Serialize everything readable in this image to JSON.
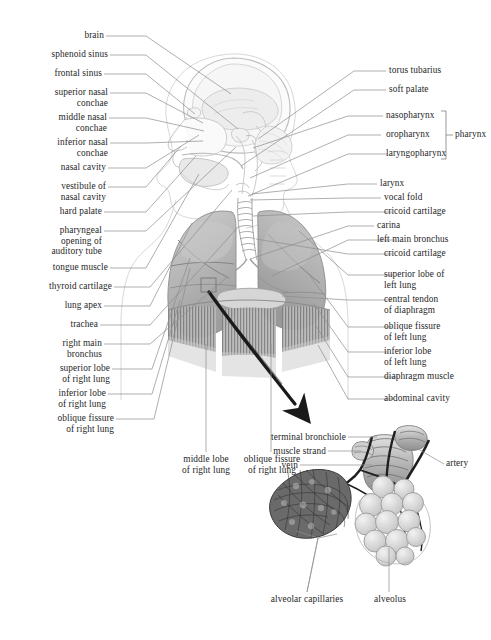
{
  "figure": {
    "kind": "anatomical-illustration",
    "background_color": "#ffffff",
    "ink_color": "#262626",
    "leader_color": "#8d8d8d",
    "arrow_color": "#1a1a1a"
  },
  "labels_left": [
    {
      "text": "brain",
      "lines": [
        "brain"
      ]
    },
    {
      "text": "sphenoid sinus",
      "lines": [
        "sphenoid sinus"
      ]
    },
    {
      "text": "frontal sinus",
      "lines": [
        "frontal sinus"
      ]
    },
    {
      "text": "superior nasal conchae",
      "lines": [
        "superior nasal",
        "conchae"
      ]
    },
    {
      "text": "middle nasal conchae",
      "lines": [
        "middle nasal",
        "conchae"
      ]
    },
    {
      "text": "inferior nasal conchae",
      "lines": [
        "inferior nasal",
        "conchae"
      ]
    },
    {
      "text": "nasal cavity",
      "lines": [
        "nasal cavity"
      ]
    },
    {
      "text": "vestibule of nasal cavity",
      "lines": [
        "vestibule of",
        "nasal cavity"
      ]
    },
    {
      "text": "hard palate",
      "lines": [
        "hard palate"
      ]
    },
    {
      "text": "pharyngeal opening of auditory tube",
      "lines": [
        "pharyngeal",
        "opening of",
        "auditory tube"
      ]
    },
    {
      "text": "tongue muscle",
      "lines": [
        "tongue muscle"
      ]
    },
    {
      "text": "thyroid cartilage",
      "lines": [
        "thyroid cartilage"
      ]
    },
    {
      "text": "lung apex",
      "lines": [
        "lung apex"
      ]
    },
    {
      "text": "trachea",
      "lines": [
        "trachea"
      ]
    },
    {
      "text": "right main bronchus",
      "lines": [
        "right main",
        "bronchus"
      ]
    },
    {
      "text": "superior lobe of right lung",
      "lines": [
        "superior lobe",
        "of right lung"
      ]
    },
    {
      "text": "inferior lobe of right lung",
      "lines": [
        "inferior lobe",
        "of right lung"
      ]
    },
    {
      "text": "oblique fissure of right lung",
      "lines": [
        "oblique fissure",
        "of right lung"
      ]
    }
  ],
  "labels_right": [
    {
      "text": "torus tubarius",
      "lines": [
        "torus tubarius"
      ]
    },
    {
      "text": "soft palate",
      "lines": [
        "soft palate"
      ]
    },
    {
      "text": "nasopharynx",
      "lines": [
        "nasopharynx"
      ]
    },
    {
      "text": "oropharynx",
      "lines": [
        "oropharynx"
      ]
    },
    {
      "text": "laryngopharynx",
      "lines": [
        "laryngopharynx"
      ]
    },
    {
      "text": "larynx",
      "lines": [
        "larynx"
      ]
    },
    {
      "text": "vocal fold",
      "lines": [
        "vocal fold"
      ]
    },
    {
      "text": "cricoid cartilage",
      "lines": [
        "cricoid cartilage"
      ]
    },
    {
      "text": "carina",
      "lines": [
        "carina"
      ]
    },
    {
      "text": "left main bronchus",
      "lines": [
        "left main bronchus"
      ]
    },
    {
      "text": "cricoid cartilage",
      "lines": [
        "cricoid cartilage"
      ]
    },
    {
      "text": "superior lobe of left lung",
      "lines": [
        "superior lobe of",
        "left lung"
      ]
    },
    {
      "text": "central tendon of diaphragm",
      "lines": [
        "central tendon",
        "of diaphragm"
      ]
    },
    {
      "text": "oblique fissure of left lung",
      "lines": [
        "oblique fissure",
        "of left lung"
      ]
    },
    {
      "text": "inferior lobe of left lung",
      "lines": [
        "inferior lobe",
        "of left lung"
      ]
    },
    {
      "text": "diaphragm muscle",
      "lines": [
        "diaphragm muscle"
      ]
    },
    {
      "text": "abdominal cavity",
      "lines": [
        "abdominal cavity"
      ]
    }
  ],
  "bracket_group": {
    "label": "pharynx",
    "members": [
      "nasopharynx",
      "oropharynx",
      "laryngopharynx"
    ]
  },
  "labels_bottom_center": [
    {
      "text": "middle lobe of right lung",
      "lines": [
        "middle lobe",
        "of right lung"
      ]
    },
    {
      "text": "oblique fissure of right lung",
      "lines": [
        "oblique fissure",
        "of right lung"
      ]
    }
  ],
  "inset": {
    "title": "bronchiole and alveoli detail",
    "labels_left": [
      {
        "text": "terminal bronchiole",
        "lines": [
          "terminal bronchiole"
        ]
      },
      {
        "text": "muscle strand",
        "lines": [
          "muscle strand"
        ]
      },
      {
        "text": "vein",
        "lines": [
          "vein"
        ]
      }
    ],
    "labels_right": [
      {
        "text": "artery",
        "lines": [
          "artery"
        ]
      }
    ],
    "labels_bottom": [
      {
        "text": "alveolar capillaries",
        "lines": [
          "alveolar capillaries"
        ]
      },
      {
        "text": "alveolus",
        "lines": [
          "alveolus"
        ]
      }
    ]
  }
}
